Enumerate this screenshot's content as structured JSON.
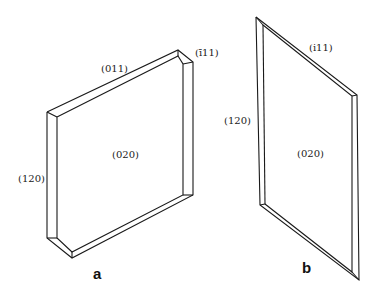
{
  "figure": {
    "crystal_a": {
      "panel_label": "a",
      "faces": {
        "top": "(011)",
        "corner": "(ī11)",
        "side": "(120)",
        "front": "(020)"
      }
    },
    "crystal_b": {
      "panel_label": "b",
      "faces": {
        "top": "(i11)",
        "side": "(120)",
        "front": "(020)"
      }
    },
    "colors": {
      "line": "#1a1a1a",
      "background": "#ffffff"
    }
  }
}
